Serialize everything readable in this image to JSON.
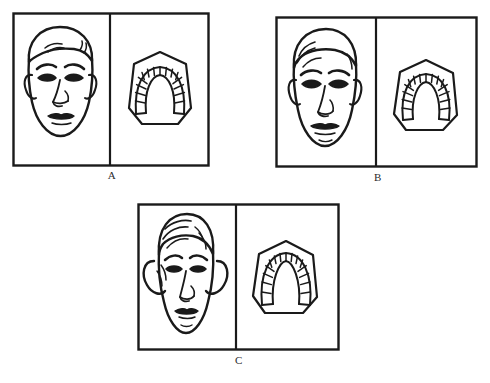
{
  "figure": {
    "background_color": "#ffffff",
    "ink_color": "#1a1a1a",
    "label_color": "#2b2b2b",
    "panel_count": 3
  },
  "panels": [
    {
      "id": "A",
      "label": "A",
      "face": {
        "description": "Frontal line drawing of a broad, round male face with short hair",
        "face_type": "brachyfacial",
        "shape": "round-broad"
      },
      "arch": {
        "description": "Occlusal view of a dental cast showing a wide, square dental arch",
        "arch_form": "square-ovoid",
        "tooth_count": 14
      }
    },
    {
      "id": "B",
      "label": "B",
      "face": {
        "description": "Frontal line drawing of an oval male face with swept hair",
        "face_type": "mesofacial",
        "shape": "oval"
      },
      "arch": {
        "description": "Occlusal view of a dental cast showing an ovoid dental arch",
        "arch_form": "ovoid",
        "tooth_count": 14
      }
    },
    {
      "id": "C",
      "label": "C",
      "face": {
        "description": "Frontal line drawing of a long, narrow face with curled hair",
        "face_type": "dolichofacial",
        "shape": "long-narrow"
      },
      "arch": {
        "description": "Occlusal view of a dental cast showing a narrow, tapered V-shaped dental arch",
        "arch_form": "tapered",
        "tooth_count": 14
      }
    }
  ]
}
